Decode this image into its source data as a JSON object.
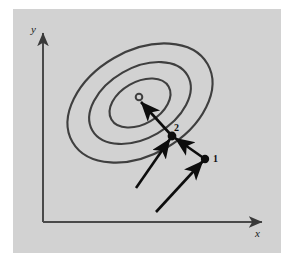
{
  "figure": {
    "kind": "contour-optimization-diagram",
    "background_color": "#ffffff",
    "panel_color": "#d2d2d2",
    "ink_color": "#3a3a3a",
    "arrow_color": "#0d0d0d",
    "axes": {
      "x_label": "x",
      "y_label": "x",
      "x_axis_name": "x-axis",
      "y_axis_name": "y-axis"
    },
    "labels": {
      "y": "y",
      "x": "x",
      "point1": "1",
      "point2": "2"
    },
    "markers": {
      "minimum": "open-circle",
      "point1": "filled-dot",
      "point2": "filled-dot"
    },
    "contours": [
      {
        "name": "outer-contour",
        "cx": 140,
        "cy": 103,
        "rx": 78,
        "ry": 52,
        "rotation": -30
      },
      {
        "name": "middle-contour",
        "cx": 140,
        "cy": 103,
        "rx": 55,
        "ry": 35,
        "rotation": -30
      },
      {
        "name": "inner-contour",
        "cx": 140,
        "cy": 103,
        "rx": 33,
        "ry": 21,
        "rotation": -30
      }
    ],
    "steps": [
      {
        "name": "step-arrow-1",
        "from": [
          156,
          212
        ],
        "to": [
          205,
          159
        ]
      },
      {
        "name": "step-arrow-2",
        "from": [
          136,
          188
        ],
        "to": [
          172,
          136
        ]
      },
      {
        "name": "step-arrow-3",
        "from": [
          205,
          159
        ],
        "to": [
          172,
          136
        ]
      },
      {
        "name": "step-arrow-4",
        "from": [
          172,
          136
        ],
        "to": [
          139,
          100
        ]
      }
    ],
    "points": [
      {
        "name": "point-1",
        "x": 205,
        "y": 159,
        "label": "1"
      },
      {
        "name": "point-2",
        "x": 172,
        "y": 136,
        "label": "2"
      }
    ],
    "minimum": {
      "name": "minimum-marker",
      "x": 139,
      "y": 97
    }
  }
}
